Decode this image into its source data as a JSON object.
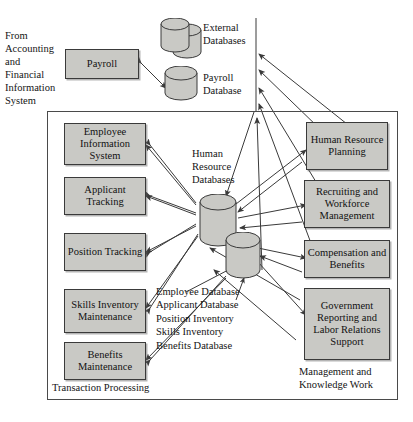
{
  "diagram": {
    "source_note": "From\nAccounting\nand\nFinancial\nInformation\nSystem",
    "colors": {
      "box_fill": "#c9c9c5",
      "box_stroke": "#3a3a3a",
      "cylinder_fill": "#c9c9c5",
      "line": "#3a3a3a",
      "background": "#ffffff"
    },
    "top": {
      "payroll_label": "Payroll",
      "external_databases_label": "External\nDatabases",
      "payroll_database_label": "Payroll\nDatabase"
    },
    "sections": {
      "left_caption": "Transaction Processing",
      "right_caption": "Management and\nKnowledge Work"
    },
    "center": {
      "databases_label": "Human\nResource\nDatabases",
      "database_list": [
        "Employee Database",
        "Applicant Database",
        "Position Inventory",
        "Skills Inventory",
        "Benefits Database"
      ]
    },
    "transaction_processing": [
      {
        "label": "Employee\nInformation\nSystem"
      },
      {
        "label": "Applicant\nTracking"
      },
      {
        "label": "Position\nTracking"
      },
      {
        "label": "Skills\nInventory\nMaintenance"
      },
      {
        "label": "Benefits\nMaintenance"
      }
    ],
    "management_knowledge_work": [
      {
        "label": "Human\nResource\nPlanning"
      },
      {
        "label": "Recruiting and\nWorkforce\nManagement"
      },
      {
        "label": "Compensation\nand Benefits"
      },
      {
        "label": "Government\nReporting\nand Labor\nRelations\nSupport"
      }
    ]
  }
}
